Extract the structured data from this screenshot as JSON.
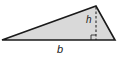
{
  "diagram": {
    "type": "triangle-area",
    "labels": {
      "base": "b",
      "height": "h"
    },
    "colors": {
      "fill": "#d9d9d9",
      "stroke": "#1a1a1a",
      "background": "#ffffff"
    },
    "vertices": {
      "left": [
        2,
        40
      ],
      "apex": [
        96,
        6
      ],
      "right": [
        115,
        40
      ]
    },
    "height_foot": [
      96,
      40
    ],
    "right_angle_marker": true
  }
}
